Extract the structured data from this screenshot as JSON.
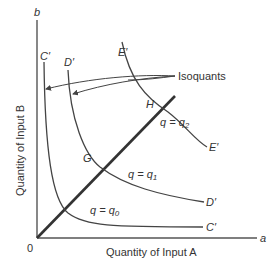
{
  "diagram": {
    "axes": {
      "x_end_label": "a",
      "y_end_label": "b",
      "origin_label": "0",
      "x_title": "Quantity of Input A",
      "y_title": "Quantity of Input B"
    },
    "curves": [
      {
        "id": "C",
        "top_label": "C′",
        "end_label": "C′",
        "eq_q": "q",
        "eq_eq": " = ",
        "eq_rhs": "q",
        "eq_sub": "0"
      },
      {
        "id": "D",
        "top_label": "D′",
        "end_label": "D′",
        "eq_q": "q",
        "eq_eq": " = ",
        "eq_rhs": "q",
        "eq_sub": "1"
      },
      {
        "id": "E",
        "top_label": "E′",
        "end_label": "E′",
        "eq_q": "q",
        "eq_eq": " = ",
        "eq_rhs": "q",
        "eq_sub": "2"
      }
    ],
    "points": {
      "G": "G",
      "H": "H"
    },
    "annotation": "Isoquants",
    "colors": {
      "line": "#444444",
      "ray": "#333333",
      "text": "#333333"
    }
  }
}
